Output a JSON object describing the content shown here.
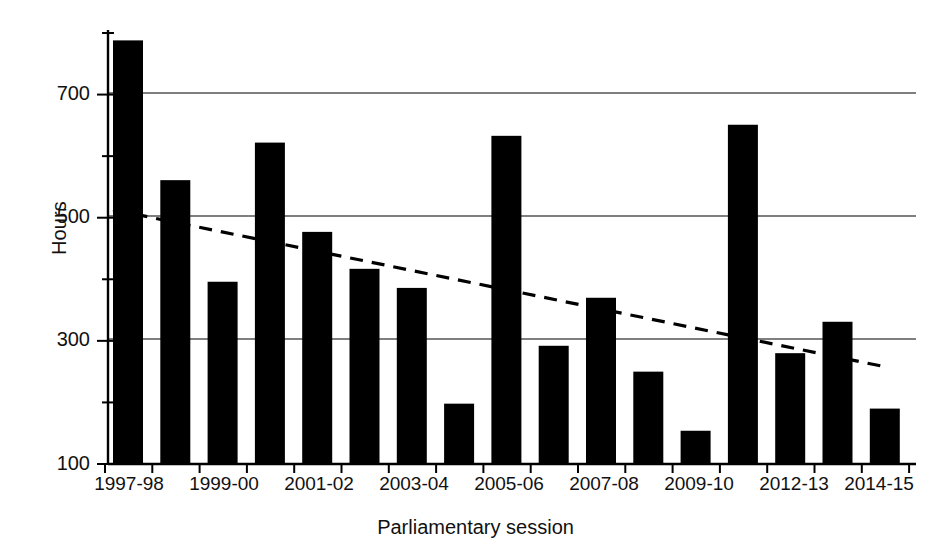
{
  "chart_data": {
    "type": "bar",
    "title": "",
    "xlabel": "Parliamentary session",
    "ylabel": "Hours",
    "ylim": [
      100,
      800
    ],
    "yticks_major": [
      100,
      300,
      500,
      700
    ],
    "yticks_minor": [
      200,
      400,
      600,
      800
    ],
    "grid": "horizontal gridlines at 300, 500, 700",
    "legend": "none",
    "bar_color": "#000000",
    "gridline_color": "#555555",
    "axis_color": "#000000",
    "categories": [
      "1997-98",
      "1998-99",
      "1999-00",
      "2000-01",
      "2001-02",
      "2002-03",
      "2003-04",
      "2004-05",
      "2005-06",
      "2006-07",
      "2007-08",
      "2008-09",
      "2009-10",
      "2010-12",
      "2012-13",
      "2013-14",
      "2014-15"
    ],
    "values": [
      788,
      561,
      396,
      622,
      477,
      417,
      386,
      198,
      633,
      292,
      370,
      250,
      154,
      651,
      280,
      331,
      190
    ],
    "xtick_labels": [
      "1997-98",
      "1999-00",
      "2001-02",
      "2003-04",
      "2005-06",
      "2007-08",
      "2009-10",
      "2012-13",
      "2014-15"
    ],
    "xtick_categories": [
      "1997-98",
      "1999-00",
      "2001-02",
      "2003-04",
      "2005-06",
      "2007-08",
      "2009-10",
      "2012-13",
      "2014-15"
    ],
    "trendline": {
      "style": "dashed",
      "color": "#000000",
      "start": {
        "category": "1997-98",
        "value": 513
      },
      "end": {
        "category": "2014-15",
        "value": 258
      }
    }
  },
  "axis": {
    "y_label": "Hours",
    "x_label": "Parliamentary session"
  }
}
